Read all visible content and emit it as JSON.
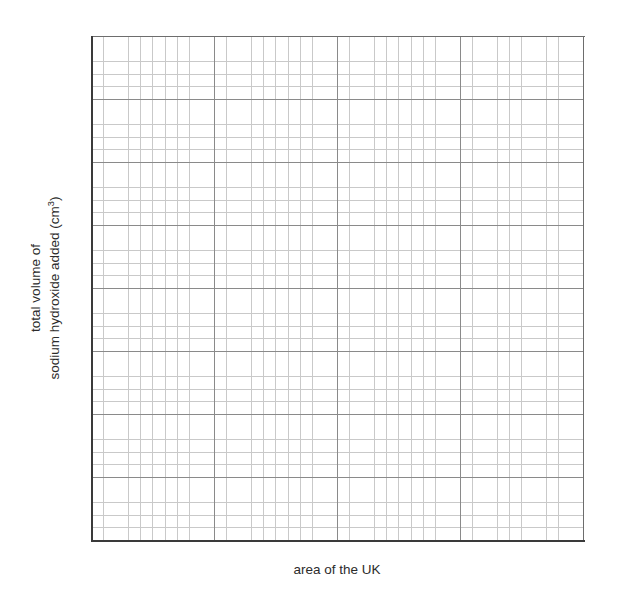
{
  "chart_data": {
    "type": "line",
    "title": "",
    "subtitle": "",
    "xlabel": "area of the UK",
    "ylabel_line1": "total volume of",
    "ylabel_line2_prefix": "sodium hydroxide added (cm",
    "ylabel_line2_superscript": "3",
    "ylabel_line2_suffix": ")",
    "ylabel_full": "total volume of sodium hydroxide added (cm3)",
    "series": [],
    "x": [],
    "values": [],
    "categories": [],
    "xtick_labels": [],
    "ytick_labels": [],
    "xlim": [
      0,
      8
    ],
    "ylim": [
      0,
      8
    ],
    "grid": "on",
    "grid_style": "graph-paper",
    "major_gridlines_x": 8,
    "major_gridlines_y": 8,
    "minor_per_major_x": 5,
    "minor_per_major_y": 5,
    "legend": "none",
    "annotations": [],
    "plot_empty": true
  },
  "figure": {
    "background_color": "#ffffff",
    "frame_color": "#3a3a3a",
    "major_grid_color": "#8a8a8a",
    "minor_grid_color": "#c9c9c9",
    "text_color": "#2b2b2b"
  },
  "axes": {
    "x_label": "area of the UK",
    "y_label_line_1": "total volume of",
    "y_label_line_2_main": "sodium hydroxide added (cm",
    "y_label_line_2_sup": "3",
    "y_label_line_2_end": ")"
  }
}
